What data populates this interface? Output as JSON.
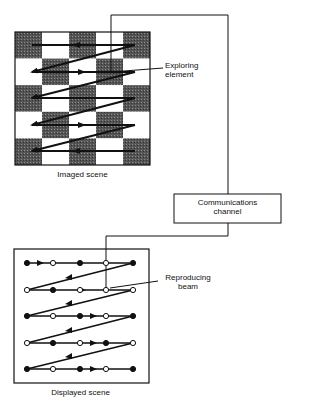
{
  "diagram": {
    "imaged_scene": {
      "caption": "Imaged scene",
      "grid": {
        "rows": 5,
        "cols": 5,
        "pattern": [
          [
            "dark",
            "light",
            "dark",
            "light",
            "dark"
          ],
          [
            "light",
            "dark",
            "light",
            "dark",
            "light"
          ],
          [
            "dark",
            "light",
            "dark",
            "light",
            "dark"
          ],
          [
            "light",
            "dark",
            "light",
            "dark",
            "light"
          ],
          [
            "dark",
            "light",
            "dark",
            "light",
            "dark"
          ]
        ]
      },
      "callout": "Exploring element"
    },
    "channel": {
      "label_line1": "Communications",
      "label_line2": "channel"
    },
    "displayed_scene": {
      "caption": "Displayed scene",
      "dots": [
        [
          "filled",
          "open",
          "filled",
          "open",
          "filled"
        ],
        [
          "open",
          "filled",
          "open",
          "open",
          "open"
        ],
        [
          "filled",
          "open",
          "filled",
          "open",
          "filled"
        ],
        [
          "open",
          "filled",
          "open",
          "filled",
          "open"
        ],
        [
          "filled",
          "open",
          "filled",
          "open",
          "filled"
        ]
      ],
      "callout_line1": "Reproducing",
      "callout_line2": "beam"
    },
    "colors": {
      "dark_cell": "#5a5a5a",
      "light_cell": "#ffffff",
      "line": "#111111"
    }
  }
}
